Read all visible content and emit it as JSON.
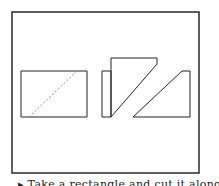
{
  "figure": {
    "frame": {
      "x": 12,
      "y": 12,
      "width": 187,
      "height": 161,
      "stroke": "#1a1a1a"
    },
    "rectangle": {
      "points": "21,71 87,71 87,117 21,117",
      "diagonal": {
        "x1": 29,
        "y1": 117,
        "x2": 77,
        "y2": 71,
        "style": "dashed"
      }
    },
    "pieces": [
      {
        "name": "left-strip",
        "points": "102,71 111,71 111,117 102,117"
      },
      {
        "name": "middle-trapezoid",
        "points": "111,58 157,58 157,64 111,117"
      },
      {
        "name": "right-trapezoid",
        "points": "182,71 190,71 190,117 133,117"
      }
    ],
    "stroke_color": "#222222",
    "dash_color": "#888888"
  },
  "caption": {
    "text": "▸ Take a rectangle and cut it along the"
  }
}
